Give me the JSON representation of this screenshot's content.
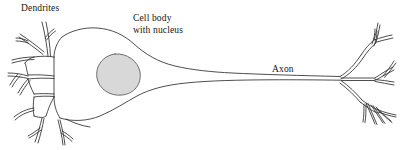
{
  "figure": {
    "kind": "neuron-anatomy-diagram",
    "background_color": "#ffffff",
    "stroke_color": "#3a3a3a",
    "nucleus_fill_color": "#d8d8d8",
    "nucleus_stroke_color": "#6e6e6e",
    "width": 419,
    "height": 150
  },
  "labels": {
    "dendrites": "Dendrites",
    "cell_body_line1": "Cell body",
    "cell_body_line2": "with nucleus",
    "axon": "Axon"
  },
  "parts": [
    {
      "name": "dendrites",
      "label": "Dendrites",
      "location": "left"
    },
    {
      "name": "cell-body",
      "label": "Cell body with nucleus",
      "location": "center-left"
    },
    {
      "name": "nucleus",
      "label": "nucleus",
      "location": "center-left"
    },
    {
      "name": "axon",
      "label": "Axon",
      "location": "center-right"
    },
    {
      "name": "axon-terminals",
      "label": "",
      "location": "right"
    }
  ]
}
